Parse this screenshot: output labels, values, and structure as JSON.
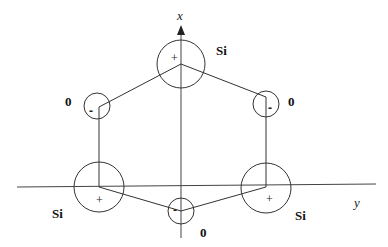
{
  "diagram": {
    "axes": {
      "x_label": "x",
      "y_label": "y"
    },
    "atoms": [
      {
        "id": "si-top",
        "element": "Si",
        "label": "Si",
        "charge": "+",
        "size": "large"
      },
      {
        "id": "o-top-right",
        "element": "O",
        "label": "0",
        "charge": "-",
        "size": "small"
      },
      {
        "id": "si-bottom-right",
        "element": "Si",
        "label": "Si",
        "charge": "+",
        "size": "large"
      },
      {
        "id": "o-bottom",
        "element": "O",
        "label": "0",
        "charge": "-",
        "size": "small"
      },
      {
        "id": "si-bottom-left",
        "element": "Si",
        "label": "Si",
        "charge": "+",
        "size": "large"
      },
      {
        "id": "o-top-left",
        "element": "O",
        "label": "0",
        "charge": "-",
        "size": "small"
      }
    ],
    "colors": {
      "stroke": "#333333",
      "background": "#ffffff"
    }
  }
}
